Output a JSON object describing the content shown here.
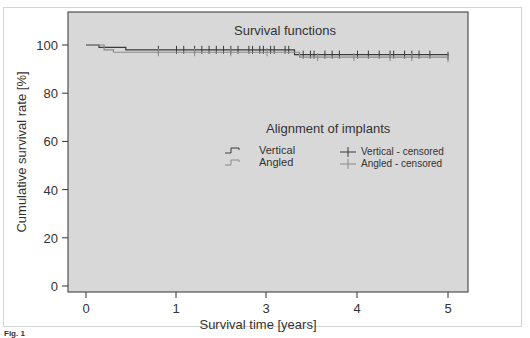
{
  "chart_data": {
    "type": "line",
    "title": "Survival functions",
    "xlabel": "Survival time [years]",
    "ylabel": "Cumulative survival rate [%]",
    "x_ticks": [
      0,
      1,
      2,
      3,
      4,
      5
    ],
    "x_tick_labels": [
      "0",
      "1",
      "3",
      "4",
      "5"
    ],
    "y_ticks": [
      0,
      20,
      40,
      60,
      80,
      100
    ],
    "y_tick_labels": [
      "0",
      "20",
      "40",
      "60",
      "80",
      "100"
    ],
    "xlim": [
      -0.2,
      5.2
    ],
    "ylim": [
      -3,
      113
    ],
    "grid": false,
    "legend": {
      "title": "Alignment of implants",
      "position": "center-right",
      "entries": [
        "Vertical",
        "Angled",
        "Vertical - censored",
        "Angled - censored"
      ]
    },
    "series": [
      {
        "name": "Vertical",
        "color": "#3a3a3a",
        "step_x": [
          0,
          0.18,
          0.55,
          2.88,
          5.0
        ],
        "step_y": [
          100,
          99,
          98,
          96,
          95.5
        ],
        "censored_x": [
          1.0,
          1.25,
          1.35,
          1.5,
          1.6,
          1.7,
          1.8,
          1.9,
          2.0,
          2.1,
          2.25,
          2.3,
          2.4,
          2.45,
          2.55,
          2.6,
          2.75,
          2.8,
          3.0,
          3.1,
          3.15,
          3.3,
          3.4,
          3.5,
          3.75,
          3.9,
          4.05,
          4.2,
          4.25,
          4.4,
          4.5,
          4.6,
          4.75,
          5.0
        ]
      },
      {
        "name": "Angled",
        "color": "#8a8a8a",
        "step_x": [
          0,
          0.25,
          0.38,
          2.95,
          5.0
        ],
        "step_y": [
          100,
          98,
          97,
          95,
          94.5
        ],
        "censored_x": [
          1.0,
          1.5,
          2.0,
          2.5,
          3.2,
          3.7,
          4.2,
          4.5,
          5.0
        ]
      }
    ]
  },
  "page": {
    "caption": "Fig. 1"
  }
}
